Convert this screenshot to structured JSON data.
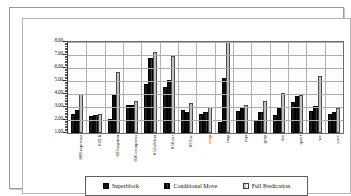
{
  "chart_data": {
    "type": "bar",
    "title": "",
    "subtitle": "",
    "xlabel": "",
    "ylabel": "",
    "ylim": [
      1.0,
      8.0
    ],
    "ytick_labels": [
      "1.00",
      "2.00",
      "3.00",
      "4.00",
      "5.00",
      "6.00",
      "7.00",
      "8.00"
    ],
    "ytick_values": [
      1.0,
      2.0,
      3.0,
      4.0,
      5.0,
      6.0,
      7.0,
      8.0
    ],
    "grid": true,
    "legend_position": "bottom",
    "categories": [
      "008.espresso",
      "022.li",
      "023.eqntott",
      "026.compress",
      "052.alvinn",
      "056.ear",
      "072.sc",
      "cccp",
      "cmp",
      "eqn",
      "grep",
      "lex",
      "qsort",
      "wc",
      "yacc"
    ],
    "series": [
      {
        "name": "Superblock",
        "color": "#1b1b1b",
        "values": [
          2.5,
          2.32,
          2.1,
          3.15,
          4.8,
          4.52,
          2.8,
          2.5,
          1.85,
          2.7,
          2.02,
          2.35,
          3.35,
          2.68,
          2.5
        ]
      },
      {
        "name": "Conditional Move",
        "color": "#2a2a2a",
        "values": [
          2.8,
          2.35,
          3.92,
          3.18,
          6.8,
          5.08,
          2.65,
          2.6,
          5.22,
          2.92,
          2.65,
          2.92,
          3.85,
          3.08,
          2.58
        ]
      },
      {
        "name": "Full Predication",
        "color": "#dcdcdc",
        "values": [
          4.0,
          2.5,
          5.72,
          3.45,
          7.2,
          6.95,
          3.32,
          3.02,
          8.0,
          3.18,
          3.45,
          4.05,
          3.95,
          5.42,
          2.9
        ]
      }
    ]
  },
  "legend": {
    "items": [
      {
        "label": "Superblock",
        "swatch": "series-0-swatch"
      },
      {
        "label": "Conditional Move",
        "swatch": "series-1-swatch"
      },
      {
        "label": "Full Predication",
        "swatch": "series-2-swatch"
      }
    ]
  }
}
